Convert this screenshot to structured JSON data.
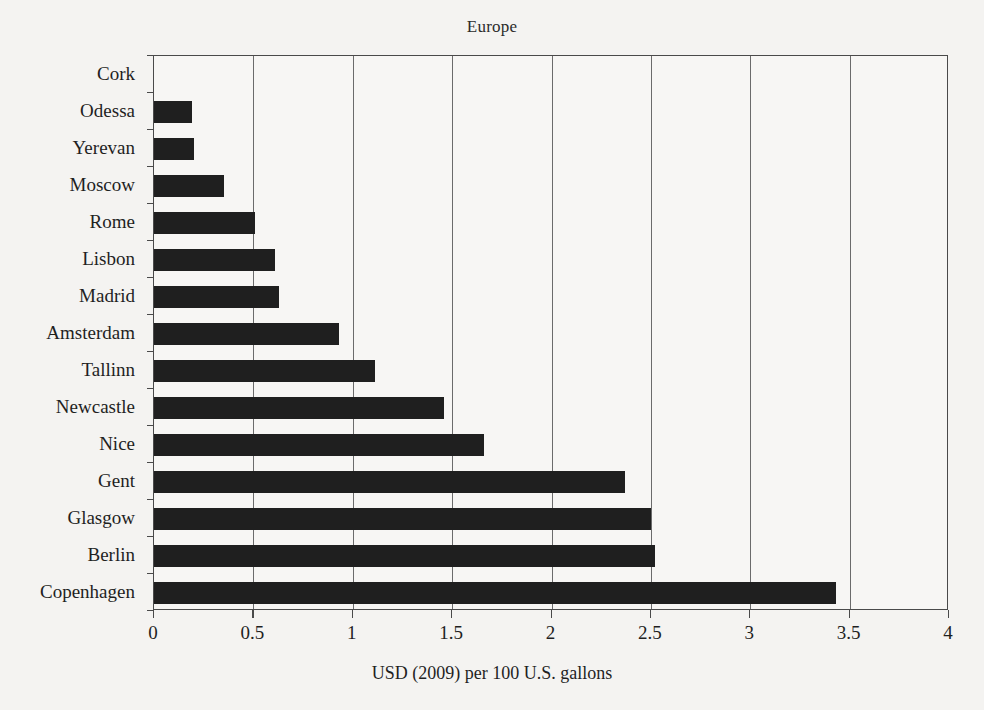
{
  "chart_data": {
    "type": "bar",
    "orientation": "horizontal",
    "title": "Europe",
    "xlabel": "USD (2009) per 100 U.S. gallons",
    "ylabel": "",
    "xlim": [
      0,
      4
    ],
    "xticks": [
      0,
      0.5,
      1,
      1.5,
      2,
      2.5,
      3,
      3.5,
      4
    ],
    "xtick_labels": [
      "0",
      "0.5",
      "1",
      "1.5",
      "2",
      "2.5",
      "3",
      "3.5",
      "4"
    ],
    "grid": "vertical",
    "legend": "none",
    "bar_color": "#1f1f1f",
    "categories": [
      "Cork",
      "Odessa",
      "Yerevan",
      "Moscow",
      "Rome",
      "Lisbon",
      "Madrid",
      "Amsterdam",
      "Tallinn",
      "Newcastle",
      "Nice",
      "Gent",
      "Glasgow",
      "Berlin",
      "Copenhagen"
    ],
    "values": [
      0,
      0.19,
      0.2,
      0.35,
      0.51,
      0.61,
      0.63,
      0.93,
      1.11,
      1.46,
      1.66,
      2.37,
      2.5,
      2.52,
      3.43
    ]
  }
}
